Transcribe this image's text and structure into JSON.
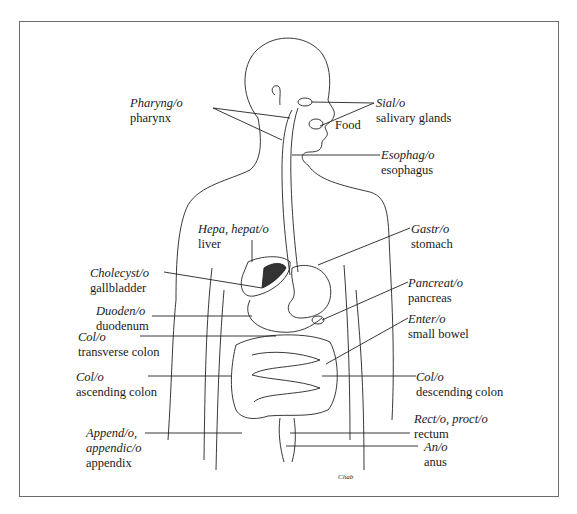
{
  "figure": {
    "signature": "Chab",
    "labels": {
      "pharynx": {
        "term": "Pharyng/o",
        "name": "pharynx"
      },
      "salivary": {
        "term": "Sial/o",
        "name": "salivary glands"
      },
      "food": {
        "name": "Food"
      },
      "esophagus": {
        "term": "Esophag/o",
        "name": "esophagus"
      },
      "liver": {
        "term": "Hepa, hepat/o",
        "name": "liver"
      },
      "stomach": {
        "term": "Gastr/o",
        "name": "stomach"
      },
      "gallbladder": {
        "term": "Cholecyst/o",
        "name": "gallbladder"
      },
      "pancreas": {
        "term": "Pancreat/o",
        "name": "pancreas"
      },
      "duodenum": {
        "term": "Duoden/o",
        "name": "duodenum"
      },
      "small_bowel": {
        "term": "Enter/o",
        "name": "small bowel"
      },
      "transverse_colon": {
        "term": "Col/o",
        "name": "transverse colon"
      },
      "ascending_colon": {
        "term": "Col/o",
        "name": "ascending colon"
      },
      "descending_colon": {
        "term": "Col/o",
        "name": "descending colon"
      },
      "rectum": {
        "term": "Rect/o, proct/o",
        "name": "rectum"
      },
      "appendix": {
        "term": "Append/o,",
        "term2": "appendic/o",
        "name": "appendix"
      },
      "anus": {
        "term": "An/o",
        "name": "anus"
      }
    }
  }
}
